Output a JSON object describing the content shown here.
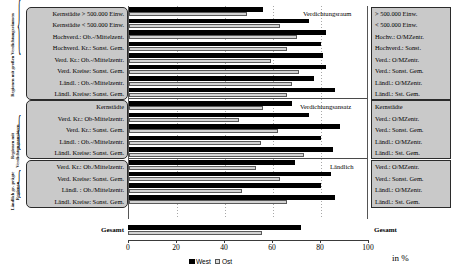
{
  "axis": {
    "ticks": [
      0,
      20,
      40,
      60,
      80,
      100
    ],
    "min": 0,
    "max": 100,
    "unit_label": "in %"
  },
  "legend": {
    "west_label": "West",
    "ost_label": "Ost",
    "west_color": "#000000",
    "ost_color": "#d3d3d3"
  },
  "side_captions": {
    "group1": "Regionen mit großen Verdichtungsräumen",
    "group2": "Regionen mit Verdichtungsansätzen",
    "group3": "Ländlich ge- prägte Regionen"
  },
  "group_tags": {
    "group1": "Verdichtungsraum",
    "group2": "Verdichtungsansatz",
    "group3": "Ländlich"
  },
  "totals": {
    "label": "Gesamt",
    "right_label": "Gesamt",
    "west": 72,
    "ost": 56
  },
  "chart_data": {
    "type": "bar",
    "orientation": "horizontal",
    "title": "",
    "xlabel": "in %",
    "ylabel": "",
    "xlim": [
      0,
      100
    ],
    "grid": true,
    "legend_position": "bottom",
    "series": [
      {
        "name": "West",
        "color": "#000000"
      },
      {
        "name": "Ost",
        "color": "#d3d3d3"
      }
    ],
    "groups": [
      {
        "name": "Verdichtungsraum",
        "side_caption": "Regionen mit großen Verdichtungsräumen",
        "rows": [
          {
            "label": "Kernstädte > 500.000 Einw.",
            "right_label": "> 500.000 Einw.",
            "west": 56,
            "ost": 49
          },
          {
            "label": "Kernstädte < 500.000 Einw.",
            "right_label": "< 500.000 Einw.",
            "west": 75,
            "ost": 63
          },
          {
            "label": "Hochverd.: Ob.-/Mittelzent.",
            "right_label": "Hochv.: O/MZentr.",
            "west": 82,
            "ost": 70
          },
          {
            "label": "Hochverd. Kr.: Sonst. Gem.",
            "right_label": "Hochverd.: Sonst.",
            "west": 80,
            "ost": 66
          },
          {
            "label": "Verd. Kr.: Ob.-/Mittelzentr.",
            "right_label": "Verd.: O/MZentr.",
            "west": 81,
            "ost": 59
          },
          {
            "label": "Verd. Kreise: Sonst. Gem.",
            "right_label": "Verd.: Sonst. Gem.",
            "west": 82,
            "ost": 71
          },
          {
            "label": "Ländl. : Ob.-/Mittelzentr.",
            "right_label": "Ländl.: O/MZentr.",
            "west": 77,
            "ost": 68
          },
          {
            "label": "Ländl. Kreise: Sonst. Gem.",
            "right_label": "Ländl.: Sst. Gem.",
            "west": 86,
            "ost": 66
          }
        ]
      },
      {
        "name": "Verdichtungsansatz",
        "side_caption": "Regionen mit Verdichtungsansätzen",
        "rows": [
          {
            "label": "Kernstädte",
            "right_label": "Kernstädte",
            "west": 68,
            "ost": 56
          },
          {
            "label": "Verd. Kr.: Ob-Mittelzentr.",
            "right_label": "Verd.: O/MZentr.",
            "west": 75,
            "ost": 46
          },
          {
            "label": "Verd. Kr.: Sonst. Gem.",
            "right_label": "Verd.: Sonst. Gem.",
            "west": 88,
            "ost": 62
          },
          {
            "label": "Ländl. : Ob.-/Mittelzentr.",
            "right_label": "Ländl.: O/MZentr.",
            "west": 80,
            "ost": 55
          },
          {
            "label": "Ländl. Kreise: Sonst. Gem.",
            "right_label": "Ländl.: Sst. Gem.",
            "west": 85,
            "ost": 73
          }
        ]
      },
      {
        "name": "Ländlich",
        "side_caption": "Ländlich geprägte Regionen",
        "rows": [
          {
            "label": "Verd. Kr.: Ob./Mittelzentr.",
            "right_label": "Verd.: O/MZentr.",
            "west": 69,
            "ost": 53
          },
          {
            "label": "Verd. Kreise: Sonst. Gem.",
            "right_label": "Verd.: Sonst. Gem.",
            "west": 84,
            "ost": 63
          },
          {
            "label": "Ländl. : Ob./Mittelzentr.",
            "right_label": "Ländl.: O/MZentr.",
            "west": 80,
            "ost": 47
          },
          {
            "label": "Ländl. Kreise: Sonst. Gem.",
            "right_label": "Ländl.: Sst. Gem.",
            "west": 86,
            "ost": 66
          }
        ]
      }
    ],
    "total": {
      "label": "Gesamt",
      "west": 72,
      "ost": 56
    }
  }
}
